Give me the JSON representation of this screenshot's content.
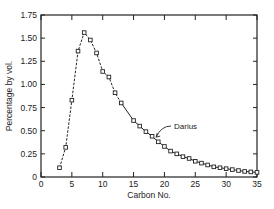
{
  "chart_data": {
    "type": "line",
    "title": "",
    "xlabel": "Carbon No.",
    "ylabel": "Percentage by vol.",
    "xlim": [
      0,
      35
    ],
    "ylim": [
      0,
      1.75
    ],
    "xticks": [
      0,
      5,
      10,
      15,
      20,
      25,
      30,
      35
    ],
    "xtick_labels": [
      "0",
      "5",
      "10",
      "15",
      "20",
      "25",
      "30",
      "35"
    ],
    "yticks": [
      0,
      0.25,
      0.5,
      0.75,
      1.0,
      1.25,
      1.5,
      1.75
    ],
    "ytick_labels": [
      "0",
      "0.25",
      "0.50",
      "0.75",
      "1.00",
      "1.25",
      "1.50",
      "1.75"
    ],
    "grid": false,
    "legend": null,
    "series": [
      {
        "name": "Darius",
        "line_style": "dashed (C3-C13), solid (C13-C35)",
        "marker": "open-square",
        "x": [
          3,
          4,
          5,
          6,
          7,
          8,
          9,
          10,
          11,
          12,
          13,
          15,
          16,
          17,
          18,
          19,
          20,
          21,
          22,
          23,
          24,
          25,
          26,
          27,
          28,
          29,
          30,
          31,
          32,
          33,
          34,
          35
        ],
        "values": [
          0.1,
          0.32,
          0.83,
          1.36,
          1.56,
          1.48,
          1.34,
          1.14,
          1.08,
          0.91,
          0.8,
          0.61,
          0.55,
          0.49,
          0.44,
          0.38,
          0.33,
          0.28,
          0.25,
          0.22,
          0.2,
          0.17,
          0.15,
          0.13,
          0.11,
          0.1,
          0.09,
          0.08,
          0.07,
          0.06,
          0.055,
          0.05
        ]
      }
    ],
    "annotations": [
      {
        "text": "Darius",
        "points_to_x": 18.5,
        "points_to_y": 0.42
      }
    ]
  }
}
